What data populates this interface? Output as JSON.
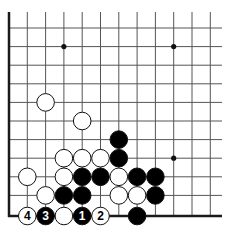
{
  "diagram": {
    "type": "go-board-corner",
    "corner": "bottom-left",
    "visible_columns": 12,
    "visible_rows": 11,
    "grid": {
      "x0": 9,
      "y0": 28,
      "spacing_x": 18.3,
      "spacing_y": 18.6,
      "right_end": 222,
      "top_start": 12,
      "line_color": "#555555",
      "edge_color": "#1a1a1a"
    },
    "star_points": [
      {
        "col": 3,
        "row": 1
      },
      {
        "col": 9,
        "row": 1
      },
      {
        "col": 9,
        "row": 7
      }
    ],
    "stones": [
      {
        "color": "white",
        "col": 2,
        "row": 4,
        "label": ""
      },
      {
        "color": "white",
        "col": 4,
        "row": 5,
        "label": ""
      },
      {
        "color": "black",
        "col": 6,
        "row": 6,
        "label": ""
      },
      {
        "color": "white",
        "col": 3,
        "row": 7,
        "label": ""
      },
      {
        "color": "white",
        "col": 4,
        "row": 7,
        "label": ""
      },
      {
        "color": "white",
        "col": 5,
        "row": 7,
        "label": ""
      },
      {
        "color": "black",
        "col": 6,
        "row": 7,
        "label": ""
      },
      {
        "color": "white",
        "col": 1,
        "row": 8,
        "label": ""
      },
      {
        "color": "white",
        "col": 3,
        "row": 8,
        "label": ""
      },
      {
        "color": "black",
        "col": 4,
        "row": 8,
        "label": ""
      },
      {
        "color": "black",
        "col": 5,
        "row": 8,
        "label": ""
      },
      {
        "color": "white",
        "col": 6,
        "row": 8,
        "label": ""
      },
      {
        "color": "black",
        "col": 7,
        "row": 8,
        "label": ""
      },
      {
        "color": "black",
        "col": 8,
        "row": 8,
        "label": ""
      },
      {
        "color": "white",
        "col": 2,
        "row": 9,
        "label": ""
      },
      {
        "color": "black",
        "col": 3,
        "row": 9,
        "label": ""
      },
      {
        "color": "black",
        "col": 4,
        "row": 9,
        "label": ""
      },
      {
        "color": "white",
        "col": 6,
        "row": 9,
        "label": ""
      },
      {
        "color": "white",
        "col": 7,
        "row": 9,
        "label": ""
      },
      {
        "color": "black",
        "col": 8,
        "row": 9,
        "label": ""
      },
      {
        "color": "white",
        "col": 1,
        "row": 10,
        "label": "4"
      },
      {
        "color": "black",
        "col": 2,
        "row": 10,
        "label": "3"
      },
      {
        "color": "white",
        "col": 3,
        "row": 10,
        "label": ""
      },
      {
        "color": "black",
        "col": 4,
        "row": 10,
        "label": "1"
      },
      {
        "color": "white",
        "col": 5,
        "row": 10,
        "label": "2"
      },
      {
        "color": "black",
        "col": 7,
        "row": 10,
        "label": ""
      }
    ],
    "colors": {
      "black_stone": "#000000",
      "white_stone": "#ffffff",
      "stone_outline": "#111111",
      "label_on_black": "#ffffff",
      "label_on_white": "#000000"
    }
  }
}
